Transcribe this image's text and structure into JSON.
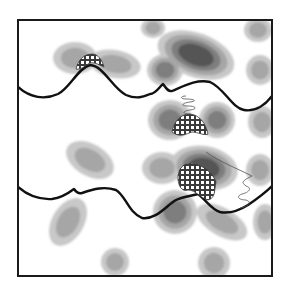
{
  "figure": {
    "frame": {
      "x": 18,
      "y": 20,
      "width": 254,
      "height": 256,
      "stroke": "#1a1a1a"
    },
    "colors": {
      "background": "#ffffff",
      "level1": "#c8c8c8",
      "level2": "#a6a6a6",
      "level3": "#7e7e7e",
      "level4": "#555555",
      "level5": "#2e2e2e",
      "boundary": "#111111",
      "hatch": "#3a3a3a",
      "thin_line": "#555555"
    },
    "blobs": [
      {
        "cx": 75,
        "cy": 58,
        "rx": 22,
        "ry": 16,
        "rot": 0,
        "levels": 2
      },
      {
        "cx": 115,
        "cy": 64,
        "rx": 26,
        "ry": 14,
        "rot": 10,
        "levels": 2
      },
      {
        "cx": 153,
        "cy": 28,
        "rx": 12,
        "ry": 10,
        "rot": 0,
        "levels": 2
      },
      {
        "cx": 196,
        "cy": 55,
        "rx": 40,
        "ry": 22,
        "rot": 20,
        "levels": 4
      },
      {
        "cx": 165,
        "cy": 70,
        "rx": 18,
        "ry": 16,
        "rot": 0,
        "levels": 3
      },
      {
        "cx": 258,
        "cy": 30,
        "rx": 14,
        "ry": 12,
        "rot": 0,
        "levels": 2
      },
      {
        "cx": 260,
        "cy": 70,
        "rx": 14,
        "ry": 15,
        "rot": 0,
        "levels": 2
      },
      {
        "cx": 170,
        "cy": 120,
        "rx": 22,
        "ry": 20,
        "rot": 0,
        "levels": 3
      },
      {
        "cx": 217,
        "cy": 120,
        "rx": 18,
        "ry": 18,
        "rot": 0,
        "levels": 3
      },
      {
        "cx": 262,
        "cy": 122,
        "rx": 14,
        "ry": 16,
        "rot": 0,
        "levels": 2
      },
      {
        "cx": 90,
        "cy": 160,
        "rx": 26,
        "ry": 16,
        "rot": 30,
        "levels": 2
      },
      {
        "cx": 204,
        "cy": 168,
        "rx": 34,
        "ry": 22,
        "rot": 10,
        "levels": 4
      },
      {
        "cx": 162,
        "cy": 168,
        "rx": 20,
        "ry": 16,
        "rot": 0,
        "levels": 2
      },
      {
        "cx": 260,
        "cy": 170,
        "rx": 14,
        "ry": 16,
        "rot": 0,
        "levels": 2
      },
      {
        "cx": 175,
        "cy": 212,
        "rx": 22,
        "ry": 22,
        "rot": 0,
        "levels": 3
      },
      {
        "cx": 222,
        "cy": 222,
        "rx": 28,
        "ry": 14,
        "rot": 30,
        "levels": 2
      },
      {
        "cx": 265,
        "cy": 222,
        "rx": 12,
        "ry": 18,
        "rot": 0,
        "levels": 2
      },
      {
        "cx": 68,
        "cy": 222,
        "rx": 16,
        "ry": 26,
        "rot": 30,
        "levels": 2
      },
      {
        "cx": 115,
        "cy": 262,
        "rx": 14,
        "ry": 14,
        "rot": 0,
        "levels": 2
      },
      {
        "cx": 214,
        "cy": 263,
        "rx": 16,
        "ry": 16,
        "rot": 20,
        "levels": 2
      }
    ],
    "boundaries": [
      {
        "name": "upper-boundary",
        "d": "M18,87 C30,98 45,100 58,94 C70,88 78,68 90,65 C104,66 112,88 126,95 C138,100 145,96 150,94 C156,94 160,86 163,84 C166,88 168,92 172,91 C184,86 196,79 210,82 C224,88 232,108 244,110 C256,112 266,104 272,96"
      },
      {
        "name": "lower-boundary",
        "d": "M18,187 C26,194 36,200 52,199 C62,198 70,192 74,189 C76,192 78,194 82,193 C94,189 104,186 116,190 C126,196 128,212 142,218 C156,220 166,206 176,200 C184,196 192,196 198,194 C206,200 212,210 220,212 C230,214 240,210 248,205 C258,198 266,192 272,186"
      }
    ],
    "hatched_regions": [
      {
        "name": "hatch-top",
        "d": "M76,69 C78,60 84,54 92,54 C98,54 102,60 104,67 C98,64 92,61 88,64 C84,67 80,70 76,69 Z"
      },
      {
        "name": "hatch-middle",
        "d": "M172,132 C174,122 180,114 190,114 C200,115 206,124 208,134 C204,136 198,132 192,132 C186,134 180,138 172,132 Z"
      },
      {
        "name": "hatch-bottom",
        "d": "M178,178 C178,168 184,162 194,164 C204,166 212,172 216,182 C214,190 216,198 208,200 C200,198 196,190 188,190 C182,192 178,186 178,178 Z"
      }
    ],
    "thin_lines": [
      {
        "name": "zigzag-upper",
        "d": "M186,96 C180,96 180,99 186,99 C194,99 198,101 190,102 C182,103 180,106 188,106 C196,106 198,109 190,110 C182,111 182,114 190,114"
      },
      {
        "name": "zigzag-lower",
        "d": "M206,152 C220,162 236,168 252,176 C244,180 240,182 246,186 C252,188 250,192 242,194 C236,196 238,200 246,200 C252,202 250,206 240,208"
      }
    ]
  }
}
